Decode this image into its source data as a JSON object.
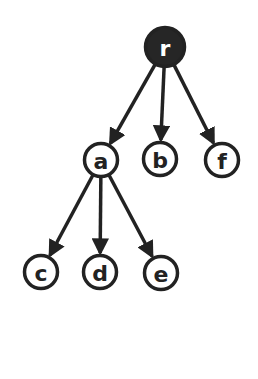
{
  "diagram": {
    "type": "tree",
    "colors": {
      "stroke": "#222222",
      "root_fill": "#262626",
      "node_fill": "#ffffff",
      "root_text": "#ffffff",
      "node_text": "#222222",
      "background": "#ffffff"
    },
    "nodes": [
      {
        "id": "r",
        "label": "r",
        "x": 165,
        "y": 47,
        "r": 21,
        "filled": true
      },
      {
        "id": "a",
        "label": "a",
        "x": 101,
        "y": 160,
        "r": 18,
        "filled": false
      },
      {
        "id": "b",
        "label": "b",
        "x": 160,
        "y": 159,
        "r": 18,
        "filled": false
      },
      {
        "id": "f",
        "label": "f",
        "x": 222,
        "y": 160,
        "r": 18,
        "filled": false
      },
      {
        "id": "c",
        "label": "c",
        "x": 41,
        "y": 272,
        "r": 18,
        "filled": false
      },
      {
        "id": "d",
        "label": "d",
        "x": 100,
        "y": 272,
        "r": 18,
        "filled": false
      },
      {
        "id": "e",
        "label": "e",
        "x": 161,
        "y": 273,
        "r": 18,
        "filled": false
      }
    ],
    "edges": [
      {
        "from": "r",
        "to": "a"
      },
      {
        "from": "r",
        "to": "b"
      },
      {
        "from": "r",
        "to": "f"
      },
      {
        "from": "a",
        "to": "c"
      },
      {
        "from": "a",
        "to": "d"
      },
      {
        "from": "a",
        "to": "e"
      }
    ]
  }
}
